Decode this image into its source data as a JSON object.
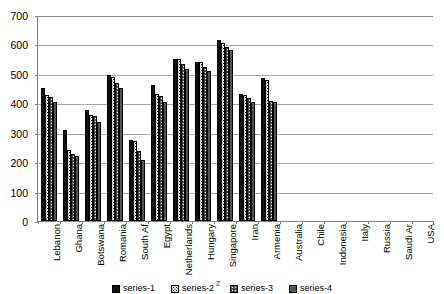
{
  "chart_data": {
    "type": "bar",
    "title": "",
    "subtitle": "",
    "xlabel": "",
    "ylabel": "",
    "ylim": [
      0,
      700
    ],
    "yticks": [
      0,
      100,
      200,
      300,
      400,
      500,
      600,
      700
    ],
    "ytick_labels": [
      "0",
      "100",
      "200",
      "300",
      "400",
      "500",
      "600",
      "700"
    ],
    "grid": "horizontal",
    "legend_position": "bottom",
    "legend_visible_fragment": "z",
    "categories": [
      "Lebanon",
      "Ghana",
      "Botswana",
      "Romania",
      "South Af",
      "Egypt",
      "Netherlands",
      "Hungary",
      "Singapore",
      "Iran",
      "Armenia",
      "Australia",
      "Chile",
      "Indonesia",
      "Italy",
      "Russia",
      "Saudi Ar",
      "USA"
    ],
    "series": [
      {
        "name": "series-1",
        "pattern": "solid-black",
        "color": "#111111",
        "values": [
          451,
          308,
          378,
          496,
          276,
          461,
          549,
          541,
          615,
          433,
          486,
          null,
          null,
          null,
          null,
          null,
          null,
          null
        ]
      },
      {
        "name": "series-2",
        "pattern": "white-dotted",
        "color": "#ffffff",
        "values": [
          428,
          243,
          361,
          488,
          272,
          432,
          551,
          540,
          604,
          428,
          478,
          null,
          null,
          null,
          null,
          null,
          null,
          null
        ]
      },
      {
        "name": "series-3",
        "pattern": "dark-checkered",
        "color": "#585858",
        "values": [
          420,
          228,
          357,
          469,
          237,
          424,
          533,
          523,
          592,
          419,
          409,
          null,
          null,
          null,
          null,
          null,
          null,
          null
        ]
      },
      {
        "name": "series-4",
        "pattern": "gray",
        "color": "#8f8f8f",
        "values": [
          404,
          222,
          336,
          451,
          208,
          404,
          517,
          509,
          582,
          404,
          404,
          null,
          null,
          null,
          null,
          null,
          null,
          null
        ]
      }
    ]
  }
}
